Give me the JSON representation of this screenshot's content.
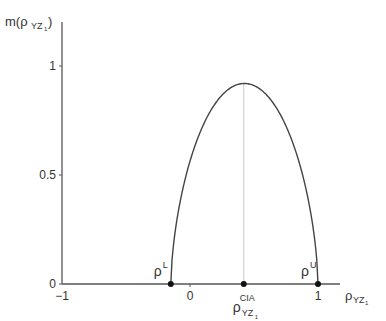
{
  "chart_data": {
    "type": "line",
    "title": "",
    "ylabel": "m(ρ_YZ1)",
    "ylabel_base": "m(ρ",
    "ylabel_sub": "YZ",
    "ylabel_subsub": "1",
    "ylabel_close": ")",
    "xlabel_base": "ρ",
    "xlabel_sub": "YZ",
    "xlabel_subsub": "1",
    "xlim": [
      -1,
      1.2
    ],
    "ylim": [
      0,
      1.2
    ],
    "x_ticks": [
      {
        "value": -1,
        "label": "−1"
      },
      {
        "value": 0,
        "label": "0"
      },
      {
        "value": 1,
        "label": "1"
      }
    ],
    "y_ticks": [
      {
        "value": 0,
        "label": "0"
      },
      {
        "value": 0.5,
        "label": "0.5"
      },
      {
        "value": 1,
        "label": "1"
      }
    ],
    "grid": false,
    "curve": {
      "rho_lower": -0.15,
      "rho_upper": 1.0,
      "rho_cia": 0.42,
      "peak_value": 0.92
    },
    "points": [
      {
        "x": -0.15,
        "y": 0,
        "label_base": "ρ",
        "label_sup": "L"
      },
      {
        "x": 0.42,
        "y": 0,
        "label_base": "ρ",
        "label_sup": "CIA",
        "label_sub": "YZ",
        "label_subsub": "1"
      },
      {
        "x": 1.0,
        "y": 0,
        "label_base": "ρ",
        "label_sup": "U"
      }
    ]
  }
}
